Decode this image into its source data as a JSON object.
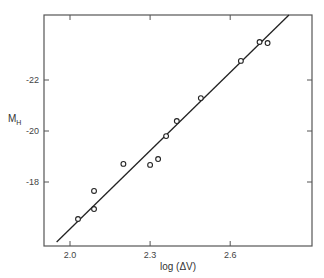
{
  "chart_data": {
    "type": "scatter",
    "title": "",
    "xlabel": "log (ΔV)",
    "ylabel": "M",
    "ylabel_subscript": "H",
    "xlim": [
      1.9,
      2.86
    ],
    "ylim": [
      -15.4,
      -24.6
    ],
    "y_inverted": true,
    "x_ticks": [
      2.0,
      2.3,
      2.6
    ],
    "x_tick_labels": [
      "2.0",
      "2.3",
      "2.6"
    ],
    "y_ticks": [
      -22,
      -20,
      -18
    ],
    "y_tick_labels": [
      "-22",
      "-20",
      "-18"
    ],
    "grid": false,
    "legend": null,
    "series": [
      {
        "name": "galaxies",
        "marker": "open-circle",
        "points": [
          {
            "x": 2.03,
            "y": -16.55
          },
          {
            "x": 2.09,
            "y": -16.94
          },
          {
            "x": 2.09,
            "y": -17.65
          },
          {
            "x": 2.2,
            "y": -18.71
          },
          {
            "x": 2.3,
            "y": -18.67
          },
          {
            "x": 2.33,
            "y": -18.9
          },
          {
            "x": 2.36,
            "y": -19.8
          },
          {
            "x": 2.4,
            "y": -20.39
          },
          {
            "x": 2.49,
            "y": -21.29
          },
          {
            "x": 2.64,
            "y": -22.75
          },
          {
            "x": 2.71,
            "y": -23.49
          },
          {
            "x": 2.74,
            "y": -23.45
          }
        ]
      },
      {
        "name": "fit",
        "type": "line",
        "points": [
          {
            "x": 1.95,
            "y": -15.65
          },
          {
            "x": 2.82,
            "y": -24.55
          }
        ]
      }
    ]
  },
  "plot_area": {
    "left": 44,
    "top": 15,
    "right": 312,
    "bottom": 246
  },
  "colors": {
    "ink": "#2a2a2a",
    "frame": "#555555",
    "background": "#ffffff"
  }
}
